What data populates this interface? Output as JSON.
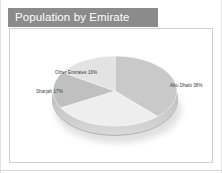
{
  "slide": {
    "title": "Population by Emirate",
    "background_color": "#ffffff",
    "title_bar_color": "#8b8b8b",
    "title_text_color": "#ffffff",
    "frame_border_color": "#cfcfcf"
  },
  "chart_data": {
    "type": "pie",
    "title": "Population by Emirate",
    "xlabel": "",
    "ylabel": "",
    "legend_position": "none",
    "grid": false,
    "labels_on_slices": true,
    "categories": [
      "Abu Dhabi",
      "Dubai",
      "Sharjah",
      "Other Emirates"
    ],
    "values": [
      38,
      29,
      17,
      16
    ],
    "unit": "%",
    "total": 100,
    "slices": [
      {
        "name": "Abu Dhabi",
        "value": 38,
        "label": "Abu Dhabi 38%",
        "color": "#c9c9c9",
        "position": "right"
      },
      {
        "name": "Dubai",
        "value": 29,
        "label": "Dubai 29%",
        "color": "#eeeeee",
        "position": "bottom"
      },
      {
        "name": "Sharjah",
        "value": 17,
        "label": "Sharjah 17%",
        "color": "#c0c0c0",
        "position": "left"
      },
      {
        "name": "Other Emirates",
        "value": 16,
        "label": "Other Emirates 16%",
        "color": "#e3e3e3",
        "position": "top-left"
      }
    ],
    "style": {
      "three_d": true,
      "depth_color": "#bdbdbd",
      "shadow": true
    }
  }
}
